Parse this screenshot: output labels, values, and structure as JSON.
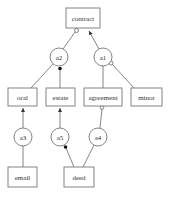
{
  "diagram": {
    "type": "argument-graph",
    "statements": [
      {
        "id": "contract",
        "label": "contract",
        "x": 66,
        "y": 8,
        "w": 34,
        "h": 20
      },
      {
        "id": "oral",
        "label": "oral",
        "x": 8,
        "y": 88,
        "w": 29,
        "h": 18
      },
      {
        "id": "estate",
        "label": "estate",
        "x": 46,
        "y": 88,
        "w": 29,
        "h": 18
      },
      {
        "id": "agreement",
        "label": "agreement",
        "x": 84,
        "y": 88,
        "w": 38,
        "h": 18
      },
      {
        "id": "minor",
        "label": "minor",
        "x": 131,
        "y": 88,
        "w": 31,
        "h": 18
      },
      {
        "id": "email",
        "label": "email",
        "x": 8,
        "y": 167,
        "w": 29,
        "h": 20
      },
      {
        "id": "deed",
        "label": "deed",
        "x": 64,
        "y": 167,
        "w": 30,
        "h": 20
      }
    ],
    "arguments": [
      {
        "id": "a1",
        "label": "a1",
        "cx": 103,
        "cy": 57,
        "r": 9
      },
      {
        "id": "a2",
        "label": "a2",
        "cx": 59,
        "cy": 57,
        "r": 9
      },
      {
        "id": "a3",
        "label": "a3",
        "cx": 23,
        "cy": 137,
        "r": 9
      },
      {
        "id": "a4",
        "label": "a4",
        "cx": 98,
        "cy": 137,
        "r": 9
      },
      {
        "id": "a5",
        "label": "a5",
        "cx": 60,
        "cy": 137,
        "r": 9
      }
    ],
    "edges": [
      {
        "from": "a2",
        "to": "contract",
        "head": "open-circle"
      },
      {
        "from": "a1",
        "to": "contract",
        "head": "arrow"
      },
      {
        "from": "oral",
        "to": "a2",
        "head": "none"
      },
      {
        "from": "estate",
        "to": "a2",
        "head": "filled-circle"
      },
      {
        "from": "agreement",
        "to": "a1",
        "head": "none"
      },
      {
        "from": "minor",
        "to": "a1",
        "head": "open-circle"
      },
      {
        "from": "a3",
        "to": "oral",
        "head": "arrow"
      },
      {
        "from": "a5",
        "to": "estate",
        "head": "arrow"
      },
      {
        "from": "a4",
        "to": "agreement",
        "head": "open-circle"
      },
      {
        "from": "email",
        "to": "a3",
        "head": "none"
      },
      {
        "from": "deed",
        "to": "a5",
        "head": "filled-circle"
      },
      {
        "from": "deed",
        "to": "a4",
        "head": "none"
      }
    ]
  }
}
